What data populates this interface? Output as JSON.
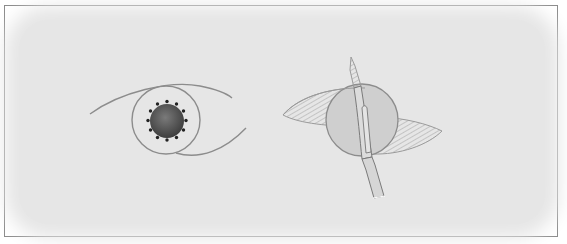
{
  "figure": {
    "panels": [
      {
        "id": "left",
        "subject": "eye-with-sutured-pupil"
      },
      {
        "id": "right",
        "subject": "eye-with-scalpel-incision"
      }
    ],
    "colors": {
      "background": "#e6e6e6",
      "frame": "#8a8a8a",
      "outline": "#8c8c8c",
      "pupil": "#5a5a5a",
      "cornea_fill": "#cfcfcf",
      "blade_fill": "#dcdcdc",
      "hatch": "#9a9a9a",
      "sutures": "#222222"
    }
  }
}
